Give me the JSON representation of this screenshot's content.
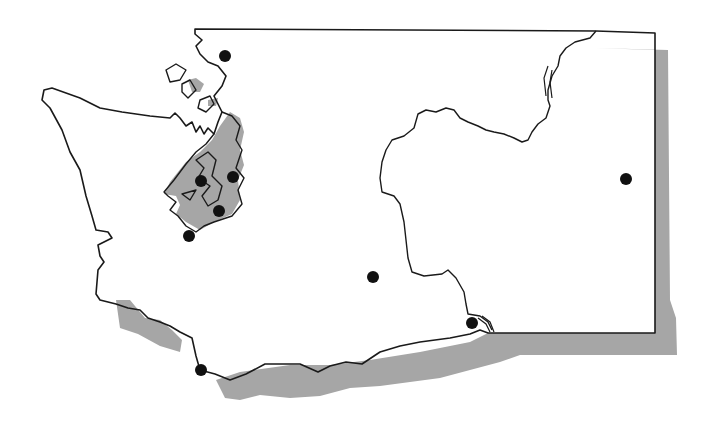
{
  "map": {
    "subject": "Washington State outline",
    "colors": {
      "background": "#ffffff",
      "land": "#ffffff",
      "outline": "#1a1a1a",
      "shadow": "#a6a6a6",
      "water": "#a6a6a6",
      "marker": "#111111"
    },
    "features": [
      "state-border",
      "drop-shadow",
      "puget-sound",
      "columbia-river",
      "snake-river"
    ],
    "markers": [
      {
        "id": "marker-1",
        "x": 225,
        "y": 56
      },
      {
        "id": "marker-2",
        "x": 201,
        "y": 181
      },
      {
        "id": "marker-3",
        "x": 233,
        "y": 177
      },
      {
        "id": "marker-4",
        "x": 219,
        "y": 211
      },
      {
        "id": "marker-5",
        "x": 189,
        "y": 236
      },
      {
        "id": "marker-6",
        "x": 373,
        "y": 277
      },
      {
        "id": "marker-7",
        "x": 626,
        "y": 179
      },
      {
        "id": "marker-8",
        "x": 472,
        "y": 323
      },
      {
        "id": "marker-9",
        "x": 201,
        "y": 370
      }
    ]
  }
}
